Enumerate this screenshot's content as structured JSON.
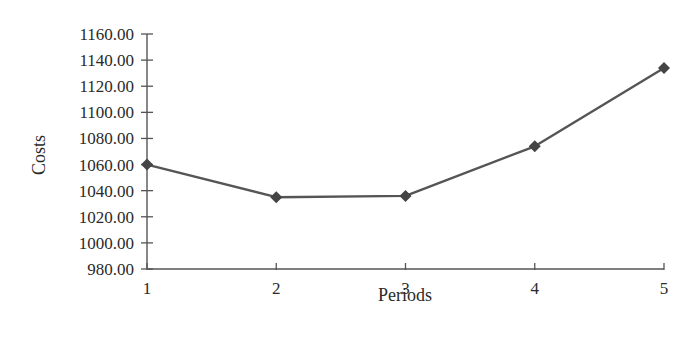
{
  "chart_data": {
    "type": "line",
    "title": "",
    "xlabel": "Periods",
    "ylabel": "Costs",
    "categories": [
      "1",
      "2",
      "3",
      "4",
      "5"
    ],
    "x": [
      1,
      2,
      3,
      4,
      5
    ],
    "series": [
      {
        "name": "Costs",
        "values": [
          1060,
          1035,
          1036,
          1074,
          1134
        ],
        "marker": "diamond",
        "color": "#555555"
      }
    ],
    "ylim": [
      980,
      1160
    ],
    "yticks": [
      980,
      1000,
      1020,
      1040,
      1060,
      1080,
      1100,
      1120,
      1140,
      1160
    ],
    "ytick_labels": [
      "980.00",
      "1000.00",
      "1020.00",
      "1040.00",
      "1060.00",
      "1080.00",
      "1100.00",
      "1120.00",
      "1140.00",
      "1160.00"
    ],
    "xlim": [
      1,
      5
    ],
    "grid": false,
    "legend": null
  },
  "labels": {
    "x_axis_title": "Periods",
    "y_axis_title": "Costs"
  },
  "colors": {
    "axis": "#555555",
    "line": "#555555",
    "marker": "#444444",
    "text": "#2a2a2a"
  }
}
